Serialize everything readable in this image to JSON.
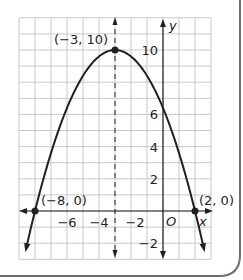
{
  "chart_data": {
    "type": "line",
    "title": "",
    "xlabel": "x",
    "ylabel": "y",
    "xlim": [
      -9,
      3
    ],
    "ylim": [
      -3,
      12
    ],
    "grid": true,
    "function": "y = -0.4(x + 3)^2 + 10",
    "series": [
      {
        "name": "parabola",
        "points": [
          [
            -8,
            0
          ],
          [
            -3,
            10
          ],
          [
            0,
            6.4
          ],
          [
            2,
            0
          ]
        ]
      }
    ],
    "axis_of_symmetry": {
      "x": -3,
      "style": "dashed"
    },
    "x_ticks": [
      {
        "value": -6,
        "label": "−6"
      },
      {
        "value": -4,
        "label": "−4"
      },
      {
        "value": -2,
        "label": "−2"
      }
    ],
    "y_ticks": [
      {
        "value": 10,
        "label": "10"
      },
      {
        "value": 6,
        "label": "6"
      },
      {
        "value": 4,
        "label": "4"
      },
      {
        "value": 2,
        "label": "2"
      },
      {
        "value": -2,
        "label": "−2"
      }
    ],
    "origin_label": "O",
    "annotations": [
      {
        "point": [
          -3,
          10
        ],
        "label": "(−3, 10)"
      },
      {
        "point": [
          -8,
          0
        ],
        "label": "(−8, 0)"
      },
      {
        "point": [
          2,
          0
        ],
        "label": "(2, 0)"
      }
    ]
  },
  "colors": {
    "grid": "#c8c8c8",
    "curve": "#231f20",
    "frame": "#6d6e71"
  }
}
